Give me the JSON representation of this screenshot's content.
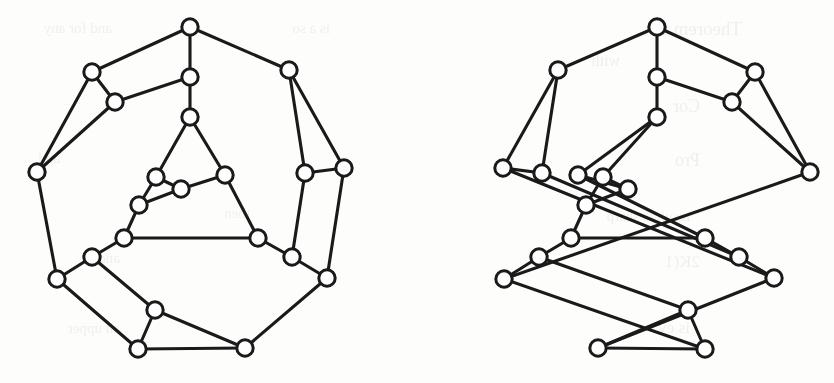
{
  "figure": {
    "caption": "",
    "background_color": "#fdfdfc",
    "ink_color": "#1a1a1a",
    "vertex_fill": "#ffffff",
    "vertex_radius": 8.2,
    "edge_width": 3.1,
    "width": 834,
    "height": 383
  },
  "bleed_through_text": [
    {
      "text": "Theorem 15",
      "x": 742,
      "y": 18,
      "size": 19
    },
    {
      "text": "and for any",
      "x": 112,
      "y": 20,
      "size": 15
    },
    {
      "text": "is a so",
      "x": 330,
      "y": 20,
      "size": 15
    },
    {
      "text": "with",
      "x": 620,
      "y": 52,
      "size": 16
    },
    {
      "text": "Cor",
      "x": 700,
      "y": 96,
      "size": 18
    },
    {
      "text": "and",
      "x": 60,
      "y": 150,
      "size": 15
    },
    {
      "text": "Pro",
      "x": 700,
      "y": 150,
      "size": 18
    },
    {
      "text": "then",
      "x": 250,
      "y": 205,
      "size": 15
    },
    {
      "text": "result is sharp",
      "x": 690,
      "y": 208,
      "size": 15
    },
    {
      "text": "and",
      "x": 120,
      "y": 250,
      "size": 15
    },
    {
      "text": "2K(1",
      "x": 700,
      "y": 252,
      "size": 17
    },
    {
      "text": "an upper",
      "x": 120,
      "y": 320,
      "size": 15
    },
    {
      "text": "is ev",
      "x": 690,
      "y": 318,
      "size": 17
    }
  ],
  "graphs": [
    {
      "name": "left-graph",
      "label": "Left cubic graph",
      "vertex_count": 20,
      "edge_count": 30,
      "vertices": [
        {
          "id": "L0",
          "x": 190,
          "y": 27
        },
        {
          "id": "L1",
          "x": 92,
          "y": 72
        },
        {
          "id": "L2",
          "x": 115,
          "y": 102
        },
        {
          "id": "L3",
          "x": 190,
          "y": 77
        },
        {
          "id": "L4",
          "x": 289,
          "y": 70
        },
        {
          "id": "L5",
          "x": 37,
          "y": 172
        },
        {
          "id": "L6",
          "x": 190,
          "y": 117
        },
        {
          "id": "L7",
          "x": 305,
          "y": 173
        },
        {
          "id": "L8",
          "x": 344,
          "y": 168
        },
        {
          "id": "L9",
          "x": 156,
          "y": 177
        },
        {
          "id": "L10",
          "x": 181,
          "y": 189
        },
        {
          "id": "L11",
          "x": 225,
          "y": 175
        },
        {
          "id": "L12",
          "x": 139,
          "y": 205
        },
        {
          "id": "L13",
          "x": 124,
          "y": 238
        },
        {
          "id": "L14",
          "x": 258,
          "y": 238
        },
        {
          "id": "L15",
          "x": 92,
          "y": 257
        },
        {
          "id": "L16",
          "x": 292,
          "y": 257
        },
        {
          "id": "L17",
          "x": 57,
          "y": 279
        },
        {
          "id": "L18",
          "x": 327,
          "y": 278
        },
        {
          "id": "L19",
          "x": 155,
          "y": 310
        },
        {
          "id": "L20",
          "x": 138,
          "y": 349
        },
        {
          "id": "L21",
          "x": 245,
          "y": 348
        }
      ],
      "edges": [
        [
          "L0",
          "L1"
        ],
        [
          "L0",
          "L3"
        ],
        [
          "L0",
          "L4"
        ],
        [
          "L1",
          "L2"
        ],
        [
          "L1",
          "L5"
        ],
        [
          "L2",
          "L3"
        ],
        [
          "L2",
          "L5"
        ],
        [
          "L3",
          "L6"
        ],
        [
          "L4",
          "L7"
        ],
        [
          "L4",
          "L8"
        ],
        [
          "L5",
          "L17"
        ],
        [
          "L6",
          "L9"
        ],
        [
          "L6",
          "L11"
        ],
        [
          "L7",
          "L8"
        ],
        [
          "L7",
          "L16"
        ],
        [
          "L8",
          "L18"
        ],
        [
          "L9",
          "L10"
        ],
        [
          "L9",
          "L12"
        ],
        [
          "L10",
          "L11"
        ],
        [
          "L10",
          "L12"
        ],
        [
          "L11",
          "L14"
        ],
        [
          "L12",
          "L13"
        ],
        [
          "L13",
          "L14"
        ],
        [
          "L13",
          "L15"
        ],
        [
          "L14",
          "L16"
        ],
        [
          "L15",
          "L17"
        ],
        [
          "L15",
          "L19"
        ],
        [
          "L16",
          "L18"
        ],
        [
          "L17",
          "L20"
        ],
        [
          "L18",
          "L21"
        ],
        [
          "L19",
          "L20"
        ],
        [
          "L19",
          "L21"
        ],
        [
          "L20",
          "L21"
        ]
      ]
    },
    {
      "name": "right-graph",
      "label": "Right cubic graph",
      "vertex_count": 20,
      "edge_count": 30,
      "vertices": [
        {
          "id": "R0",
          "x": 657,
          "y": 27
        },
        {
          "id": "R1",
          "x": 755,
          "y": 72
        },
        {
          "id": "R2",
          "x": 732,
          "y": 102
        },
        {
          "id": "R3",
          "x": 657,
          "y": 77
        },
        {
          "id": "R4",
          "x": 558,
          "y": 70
        },
        {
          "id": "R5",
          "x": 810,
          "y": 172
        },
        {
          "id": "R6",
          "x": 657,
          "y": 117
        },
        {
          "id": "R7",
          "x": 542,
          "y": 173
        },
        {
          "id": "R8",
          "x": 503,
          "y": 168
        },
        {
          "id": "R9",
          "x": 603,
          "y": 177
        },
        {
          "id": "R10",
          "x": 628,
          "y": 189
        },
        {
          "id": "R11",
          "x": 578,
          "y": 175
        },
        {
          "id": "R12",
          "x": 586,
          "y": 205
        },
        {
          "id": "R13",
          "x": 571,
          "y": 238
        },
        {
          "id": "R14",
          "x": 705,
          "y": 238
        },
        {
          "id": "R15",
          "x": 539,
          "y": 257
        },
        {
          "id": "R16",
          "x": 739,
          "y": 257
        },
        {
          "id": "R17",
          "x": 504,
          "y": 279
        },
        {
          "id": "R18",
          "x": 774,
          "y": 278
        },
        {
          "id": "R19",
          "x": 688,
          "y": 310
        },
        {
          "id": "R20",
          "x": 705,
          "y": 349
        },
        {
          "id": "R21",
          "x": 598,
          "y": 348
        }
      ],
      "edges": [
        [
          "R0",
          "R1"
        ],
        [
          "R0",
          "R3"
        ],
        [
          "R0",
          "R4"
        ],
        [
          "R1",
          "R2"
        ],
        [
          "R1",
          "R5"
        ],
        [
          "R2",
          "R3"
        ],
        [
          "R2",
          "R5"
        ],
        [
          "R3",
          "R6"
        ],
        [
          "R4",
          "R7"
        ],
        [
          "R4",
          "R8"
        ],
        [
          "R5",
          "R17"
        ],
        [
          "R6",
          "R9"
        ],
        [
          "R6",
          "R11"
        ],
        [
          "R7",
          "R8"
        ],
        [
          "R7",
          "R16"
        ],
        [
          "R8",
          "R18"
        ],
        [
          "R9",
          "R10"
        ],
        [
          "R9",
          "R12"
        ],
        [
          "R10",
          "R11"
        ],
        [
          "R10",
          "R12"
        ],
        [
          "R11",
          "R14"
        ],
        [
          "R12",
          "R13"
        ],
        [
          "R13",
          "R14"
        ],
        [
          "R13",
          "R15"
        ],
        [
          "R14",
          "R16"
        ],
        [
          "R15",
          "R17"
        ],
        [
          "R15",
          "R19"
        ],
        [
          "R16",
          "R18"
        ],
        [
          "R17",
          "R20"
        ],
        [
          "R18",
          "R21"
        ],
        [
          "R19",
          "R20"
        ],
        [
          "R19",
          "R21"
        ],
        [
          "R20",
          "R21"
        ]
      ]
    }
  ]
}
